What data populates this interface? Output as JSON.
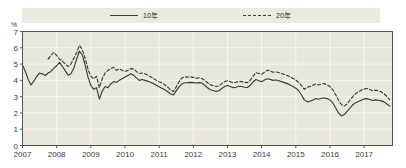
{
  "legend": {
    "entries": [
      {
        "label": "10年",
        "style": "solid",
        "icon": "solid-line-icon"
      },
      {
        "label": "20年",
        "style": "dashed",
        "icon": "dashed-line-icon"
      }
    ]
  },
  "axes": {
    "unit": "%",
    "y_ticks": [
      "0",
      "1",
      "2",
      "3",
      "4",
      "5",
      "6",
      "7"
    ],
    "x_ticks": [
      "2007",
      "2008",
      "2009",
      "2010",
      "2011",
      "2012",
      "2013",
      "2014",
      "2015",
      "2016",
      "2017"
    ]
  },
  "colors": {
    "line": "#3b3b36",
    "plot_background": "#e8e7dd",
    "legend_background": "#eceade",
    "gridline": "#f6f5ef",
    "axis": "#55554e",
    "page_background": "#ffffff"
  },
  "chart_data": {
    "type": "line",
    "title": "",
    "subtitle": "",
    "xlabel": "",
    "ylabel": "%",
    "xlim": [
      2007.0,
      2017.83
    ],
    "ylim": [
      0,
      7
    ],
    "grid": true,
    "legend_position": "top",
    "x_tick_values": [
      2007,
      2008,
      2009,
      2010,
      2011,
      2012,
      2013,
      2014,
      2015,
      2016,
      2017
    ],
    "y_tick_values": [
      0,
      1,
      2,
      3,
      4,
      5,
      6,
      7
    ],
    "x": [
      2007.0,
      2007.083,
      2007.167,
      2007.25,
      2007.333,
      2007.417,
      2007.5,
      2007.583,
      2007.667,
      2007.75,
      2007.833,
      2007.917,
      2008.0,
      2008.083,
      2008.167,
      2008.25,
      2008.333,
      2008.417,
      2008.5,
      2008.583,
      2008.667,
      2008.75,
      2008.833,
      2008.917,
      2009.0,
      2009.083,
      2009.167,
      2009.25,
      2009.333,
      2009.417,
      2009.5,
      2009.583,
      2009.667,
      2009.75,
      2009.833,
      2009.917,
      2010.0,
      2010.083,
      2010.167,
      2010.25,
      2010.333,
      2010.417,
      2010.5,
      2010.583,
      2010.667,
      2010.75,
      2010.833,
      2010.917,
      2011.0,
      2011.083,
      2011.167,
      2011.25,
      2011.333,
      2011.417,
      2011.5,
      2011.583,
      2011.667,
      2011.75,
      2011.833,
      2011.917,
      2012.0,
      2012.083,
      2012.167,
      2012.25,
      2012.333,
      2012.417,
      2012.5,
      2012.583,
      2012.667,
      2012.75,
      2012.833,
      2012.917,
      2013.0,
      2013.083,
      2013.167,
      2013.25,
      2013.333,
      2013.417,
      2013.5,
      2013.583,
      2013.667,
      2013.75,
      2013.833,
      2013.917,
      2014.0,
      2014.083,
      2014.167,
      2014.25,
      2014.333,
      2014.417,
      2014.5,
      2014.583,
      2014.667,
      2014.75,
      2014.833,
      2014.917,
      2015.0,
      2015.083,
      2015.167,
      2015.25,
      2015.333,
      2015.417,
      2015.5,
      2015.583,
      2015.667,
      2015.75,
      2015.833,
      2015.917,
      2016.0,
      2016.083,
      2016.167,
      2016.25,
      2016.333,
      2016.417,
      2016.5,
      2016.583,
      2016.667,
      2016.75,
      2016.833,
      2016.917,
      2017.0,
      2017.083,
      2017.167,
      2017.25,
      2017.333,
      2017.417,
      2017.5,
      2017.583,
      2017.667,
      2017.75
    ],
    "series": [
      {
        "name": "10年",
        "style": "solid",
        "values": [
          4.95,
          4.55,
          4.05,
          3.72,
          3.95,
          4.25,
          4.45,
          4.4,
          4.3,
          4.45,
          4.55,
          4.75,
          4.9,
          5.1,
          4.85,
          4.6,
          4.32,
          4.4,
          4.75,
          5.3,
          5.8,
          5.55,
          4.95,
          4.2,
          3.7,
          3.45,
          3.55,
          2.85,
          3.35,
          3.62,
          3.55,
          3.78,
          3.92,
          3.88,
          4.0,
          4.1,
          4.2,
          4.3,
          4.4,
          4.32,
          4.15,
          4.0,
          4.05,
          4.0,
          3.95,
          3.88,
          3.8,
          3.7,
          3.6,
          3.52,
          3.42,
          3.3,
          3.18,
          3.1,
          3.35,
          3.6,
          3.78,
          3.85,
          3.86,
          3.88,
          3.86,
          3.84,
          3.86,
          3.84,
          3.7,
          3.55,
          3.42,
          3.38,
          3.32,
          3.36,
          3.5,
          3.62,
          3.68,
          3.62,
          3.55,
          3.58,
          3.64,
          3.62,
          3.58,
          3.56,
          3.7,
          3.9,
          4.05,
          3.98,
          3.92,
          4.02,
          4.1,
          4.06,
          4.0,
          4.02,
          3.98,
          3.92,
          3.86,
          3.8,
          3.72,
          3.62,
          3.52,
          3.36,
          3.1,
          2.8,
          2.68,
          2.72,
          2.8,
          2.88,
          2.84,
          2.9,
          2.92,
          2.88,
          2.8,
          2.62,
          2.3,
          2.0,
          1.82,
          1.9,
          2.1,
          2.3,
          2.5,
          2.62,
          2.7,
          2.78,
          2.86,
          2.88,
          2.82,
          2.76,
          2.8,
          2.78,
          2.74,
          2.68,
          2.55,
          2.42
        ]
      },
      {
        "name": "20年",
        "style": "dashed",
        "values": [
          null,
          null,
          null,
          null,
          null,
          null,
          null,
          null,
          null,
          5.3,
          5.55,
          5.72,
          5.52,
          5.3,
          5.18,
          5.0,
          4.85,
          5.0,
          5.35,
          5.7,
          6.15,
          5.9,
          5.35,
          4.7,
          4.25,
          4.1,
          4.25,
          3.55,
          4.1,
          4.45,
          4.6,
          4.72,
          4.8,
          4.62,
          4.7,
          4.62,
          4.55,
          4.6,
          4.72,
          4.7,
          4.55,
          4.42,
          4.45,
          4.4,
          4.32,
          4.22,
          4.12,
          4.0,
          3.92,
          3.85,
          3.72,
          3.58,
          3.42,
          3.32,
          3.6,
          3.92,
          4.15,
          4.22,
          4.2,
          4.22,
          4.18,
          4.12,
          4.16,
          4.12,
          4.0,
          3.85,
          3.72,
          3.68,
          3.62,
          3.66,
          3.8,
          3.92,
          3.98,
          3.92,
          3.85,
          3.88,
          3.95,
          3.92,
          3.88,
          3.86,
          4.02,
          4.25,
          4.48,
          4.42,
          4.38,
          4.5,
          4.62,
          4.58,
          4.5,
          4.52,
          4.48,
          4.42,
          4.36,
          4.3,
          4.22,
          4.12,
          4.02,
          3.88,
          3.68,
          3.45,
          3.58,
          3.62,
          3.7,
          3.78,
          3.72,
          3.78,
          3.8,
          3.72,
          3.62,
          3.42,
          3.12,
          2.78,
          2.52,
          2.42,
          2.55,
          2.78,
          3.0,
          3.18,
          3.3,
          3.4,
          3.48,
          3.5,
          3.44,
          3.36,
          3.4,
          3.36,
          3.3,
          3.18,
          3.0,
          2.82
        ]
      }
    ]
  }
}
